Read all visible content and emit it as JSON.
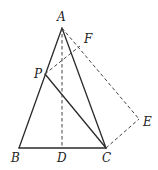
{
  "figure": {
    "type": "geometry",
    "points": {
      "A": {
        "label": "A",
        "x": 62,
        "y": 28,
        "label_x": 57,
        "label_y": 21
      },
      "B": {
        "label": "B",
        "x": 19,
        "y": 148,
        "label_x": 11,
        "label_y": 162
      },
      "C": {
        "label": "C",
        "x": 106,
        "y": 148,
        "label_x": 102,
        "label_y": 162
      },
      "D": {
        "label": "D",
        "x": 62,
        "y": 148,
        "label_x": 57,
        "label_y": 162
      },
      "P": {
        "label": "P",
        "x": 45,
        "y": 74,
        "label_x": 34,
        "label_y": 78
      },
      "F": {
        "label": "F",
        "x": 80,
        "y": 46,
        "label_x": 84,
        "label_y": 43
      },
      "E": {
        "label": "E",
        "x": 139,
        "y": 119,
        "label_x": 143,
        "label_y": 126
      }
    },
    "segments": [
      {
        "from": "A",
        "to": "B",
        "style": "solid"
      },
      {
        "from": "B",
        "to": "C",
        "style": "solid"
      },
      {
        "from": "A",
        "to": "C",
        "style": "solid"
      },
      {
        "from": "P",
        "to": "C",
        "style": "solid"
      },
      {
        "from": "A",
        "to": "D",
        "style": "dashed"
      },
      {
        "from": "P",
        "to": "F",
        "style": "dashed"
      },
      {
        "from": "A",
        "to": "E",
        "style": "dashed"
      },
      {
        "from": "C",
        "to": "E",
        "style": "dashed"
      }
    ]
  }
}
